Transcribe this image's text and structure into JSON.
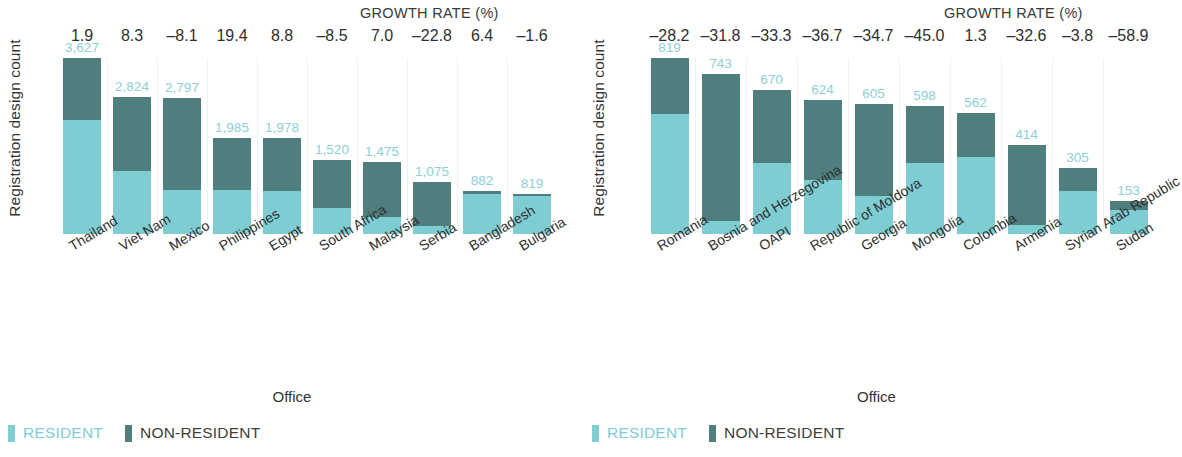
{
  "colors": {
    "resident": "#7ecdd3",
    "non_resident": "#4e7e7e",
    "value_label": "#8ccfd6",
    "grid": "#eef2f3",
    "text": "#2f2f2f"
  },
  "legend": {
    "resident_label": "RESIDENT",
    "non_resident_label": "NON-RESIDENT"
  },
  "common": {
    "growth_title": "GROWTH RATE (%)",
    "ylabel": "Registration design count",
    "xlabel": "Office"
  },
  "chart_data": [
    {
      "type": "bar",
      "id": "left",
      "title": "",
      "subtitle": "",
      "stacked": true,
      "xlabel": "Office",
      "ylabel": "Registration design count",
      "grid": true,
      "legend_position": "bottom-left",
      "annotation_title": "GROWTH RATE (%)",
      "ylim": [
        0,
        3627
      ],
      "categories": [
        "Thailand",
        "Viet Nam",
        "Mexico",
        "Philippines",
        "Egypt",
        "South Africa",
        "Malaysia",
        "Serbia",
        "Bangladesh",
        "Bulgaria"
      ],
      "totals": [
        3627,
        2824,
        2797,
        1985,
        1978,
        1520,
        1475,
        1075,
        882,
        819
      ],
      "total_labels": [
        "3,627",
        "2,824",
        "2,797",
        "1,985",
        "1,978",
        "1,520",
        "1,475",
        "1,075",
        "882",
        "819"
      ],
      "growth_rate_labels": [
        "1.9",
        "8.3",
        "–8.1",
        "19.4",
        "8.8",
        "–8.5",
        "7.0",
        "–22.8",
        "6.4",
        "–1.6"
      ],
      "growth_rate_values": [
        1.9,
        8.3,
        -8.1,
        19.4,
        8.8,
        -8.5,
        7.0,
        -22.8,
        6.4,
        -1.6
      ],
      "series": [
        {
          "name": "RESIDENT",
          "values": [
            2352,
            1307,
            900,
            900,
            890,
            530,
            350,
            160,
            830,
            775
          ]
        },
        {
          "name": "NON-RESIDENT",
          "values": [
            1275,
            1517,
            1897,
            1085,
            1088,
            990,
            1125,
            915,
            52,
            44
          ]
        }
      ]
    },
    {
      "type": "bar",
      "id": "right",
      "title": "",
      "subtitle": "",
      "stacked": true,
      "xlabel": "Office",
      "ylabel": "Registration design count",
      "grid": true,
      "legend_position": "bottom-left",
      "annotation_title": "GROWTH RATE (%)",
      "ylim": [
        0,
        819
      ],
      "categories": [
        "Romania",
        "Bosnia and Herzegovina",
        "OAPI",
        "Republic of Moldova",
        "Georgia",
        "Mongolia",
        "Colombia",
        "Armenia",
        "Syrian Arab Republic",
        "Sudan"
      ],
      "totals": [
        819,
        743,
        670,
        624,
        605,
        598,
        562,
        414,
        305,
        153
      ],
      "total_labels": [
        "819",
        "743",
        "670",
        "624",
        "605",
        "598",
        "562",
        "414",
        "305",
        "153"
      ],
      "growth_rate_labels": [
        "–28.2",
        "–31.8",
        "–33.3",
        "–36.7",
        "–34.7",
        "–45.0",
        "1.3",
        "–32.6",
        "–3.8",
        "–58.9"
      ],
      "growth_rate_values": [
        -28.2,
        -31.8,
        -33.3,
        -36.7,
        -34.7,
        -45.0,
        1.3,
        -32.6,
        -3.8,
        -58.9
      ],
      "series": [
        {
          "name": "RESIDENT",
          "values": [
            560,
            60,
            330,
            250,
            175,
            330,
            360,
            40,
            200,
            110
          ]
        },
        {
          "name": "NON-RESIDENT",
          "values": [
            259,
            683,
            340,
            374,
            430,
            268,
            202,
            374,
            105,
            43
          ]
        }
      ]
    }
  ]
}
